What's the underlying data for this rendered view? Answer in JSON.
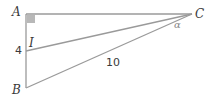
{
  "figure": {
    "type": "right-triangle-diagram",
    "points": {
      "A": {
        "label": "A",
        "x": 26,
        "y": 14
      },
      "B": {
        "label": "B",
        "x": 26,
        "y": 88
      },
      "C": {
        "label": "C",
        "x": 192,
        "y": 14
      },
      "I": {
        "label": "I",
        "x": 26,
        "y": 51
      }
    },
    "segments": [
      {
        "from": "A",
        "to": "C"
      },
      {
        "from": "A",
        "to": "B"
      },
      {
        "from": "B",
        "to": "C"
      },
      {
        "from": "I",
        "to": "C"
      }
    ],
    "right_angle_at": "A",
    "measures": {
      "AI": "4",
      "BC": "10"
    },
    "angle_label": "α",
    "colors": {
      "line": "#9a9a9a",
      "right_angle_fill": "#b8b8b8",
      "text": "#3a3a3a",
      "angle_text": "#8a8a8a"
    }
  }
}
